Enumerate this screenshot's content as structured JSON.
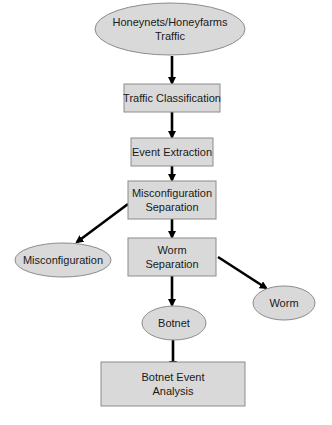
{
  "diagram": {
    "type": "flowchart",
    "nodes": [
      {
        "id": "traffic",
        "shape": "ellipse",
        "lines": [
          "Honeynets/Honeyfarms",
          "Traffic"
        ]
      },
      {
        "id": "classification",
        "shape": "rect",
        "lines": [
          "Traffic Classification"
        ]
      },
      {
        "id": "extraction",
        "shape": "rect",
        "lines": [
          "Event Extraction"
        ]
      },
      {
        "id": "misconf_sep",
        "shape": "rect",
        "lines": [
          "Misconfiguration",
          "Separation"
        ]
      },
      {
        "id": "misconf",
        "shape": "ellipse",
        "lines": [
          "Misconfiguration"
        ]
      },
      {
        "id": "worm_sep",
        "shape": "rect",
        "lines": [
          "Worm",
          "Separation"
        ]
      },
      {
        "id": "worm",
        "shape": "ellipse",
        "lines": [
          "Worm"
        ]
      },
      {
        "id": "botnet",
        "shape": "ellipse",
        "lines": [
          "Botnet"
        ]
      },
      {
        "id": "analysis",
        "shape": "rect",
        "lines": [
          "Botnet Event",
          "Analysis"
        ]
      }
    ],
    "edges": [
      {
        "from": "traffic",
        "to": "classification"
      },
      {
        "from": "classification",
        "to": "extraction"
      },
      {
        "from": "extraction",
        "to": "misconf_sep"
      },
      {
        "from": "misconf_sep",
        "to": "misconf"
      },
      {
        "from": "misconf_sep",
        "to": "worm_sep"
      },
      {
        "from": "worm_sep",
        "to": "worm"
      },
      {
        "from": "worm_sep",
        "to": "botnet"
      },
      {
        "from": "botnet",
        "to": "analysis"
      }
    ],
    "colors": {
      "node_fill": "#d9d9d9",
      "node_stroke": "#8c8c8c",
      "edge": "#000000"
    }
  }
}
